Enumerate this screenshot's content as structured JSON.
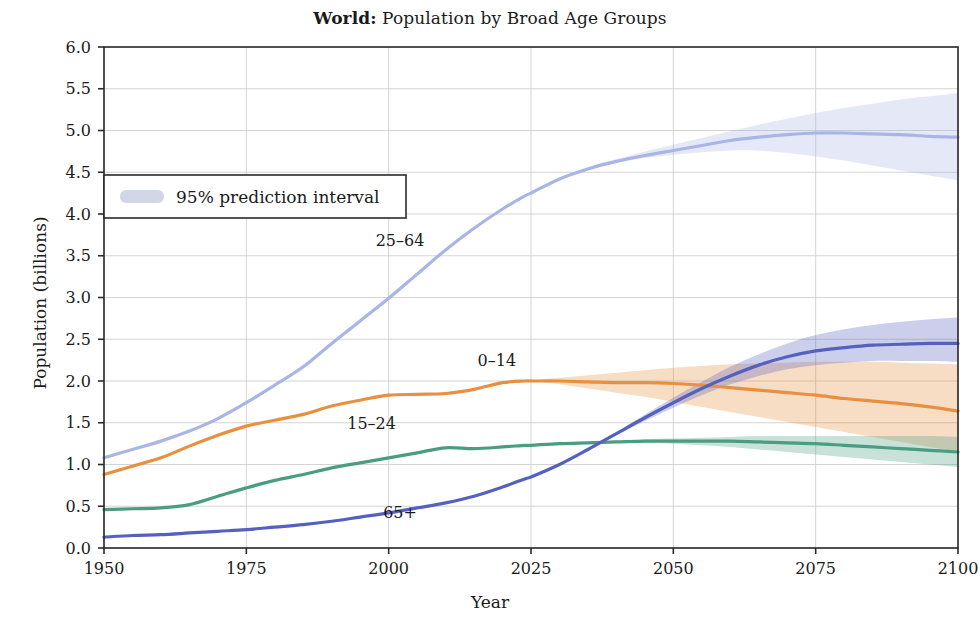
{
  "chart_data": {
    "type": "line",
    "title_prefix": "World:",
    "title": "Population by Broad Age Groups",
    "xlabel": "Year",
    "ylabel": "Population (billions)",
    "xlim": [
      1950,
      2100
    ],
    "ylim": [
      0.0,
      6.0
    ],
    "xticks": [
      1950,
      1975,
      2000,
      2025,
      2050,
      2075,
      2100
    ],
    "xtick_labels": [
      "1950",
      "1975",
      "2000",
      "2025",
      "2050",
      "2075",
      "2100"
    ],
    "yticks": [
      0.0,
      0.5,
      1.0,
      1.5,
      2.0,
      2.5,
      3.0,
      3.5,
      4.0,
      4.5,
      5.0,
      5.5,
      6.0
    ],
    "ytick_labels": [
      "0.0",
      "0.5",
      "1.0",
      "1.5",
      "2.0",
      "2.5",
      "3.0",
      "3.5",
      "4.0",
      "4.5",
      "5.0",
      "5.5",
      "6.0"
    ],
    "grid": true,
    "legend_position": "upper-left",
    "legend_entries": [
      {
        "label": "95% prediction interval",
        "swatch_color": "#c3c9de"
      }
    ],
    "projection_start_year": 2024,
    "x": [
      1950,
      1955,
      1960,
      1965,
      1970,
      1975,
      1980,
      1985,
      1990,
      1995,
      2000,
      2005,
      2010,
      2015,
      2020,
      2024,
      2025,
      2030,
      2035,
      2040,
      2045,
      2050,
      2055,
      2060,
      2065,
      2070,
      2075,
      2080,
      2085,
      2090,
      2095,
      2100
    ],
    "series": [
      {
        "name": "25-64",
        "color": "#a9b5e6",
        "annotation": "25–64",
        "annotation_x": 2002,
        "annotation_y": 3.62,
        "values": [
          1.08,
          1.18,
          1.28,
          1.4,
          1.55,
          1.74,
          1.95,
          2.17,
          2.45,
          2.72,
          2.99,
          3.28,
          3.57,
          3.83,
          4.06,
          4.22,
          4.25,
          4.42,
          4.54,
          4.63,
          4.7,
          4.76,
          4.82,
          4.88,
          4.92,
          4.95,
          4.97,
          4.97,
          4.96,
          4.95,
          4.93,
          4.92
        ],
        "band_low": [
          null,
          null,
          null,
          null,
          null,
          null,
          null,
          null,
          null,
          null,
          null,
          null,
          null,
          null,
          null,
          4.22,
          4.25,
          4.41,
          4.53,
          4.61,
          4.67,
          4.71,
          4.74,
          4.76,
          4.76,
          4.73,
          4.69,
          4.64,
          4.58,
          4.52,
          4.46,
          4.4
        ],
        "band_high": [
          null,
          null,
          null,
          null,
          null,
          null,
          null,
          null,
          null,
          null,
          null,
          null,
          null,
          null,
          null,
          4.22,
          4.25,
          4.43,
          4.56,
          4.66,
          4.75,
          4.83,
          4.91,
          4.99,
          5.07,
          5.14,
          5.21,
          5.27,
          5.32,
          5.37,
          5.41,
          5.45
        ]
      },
      {
        "name": "0-14",
        "color": "#e89040",
        "annotation": "0–14",
        "annotation_x": 2019,
        "annotation_y": 2.18,
        "values": [
          0.88,
          0.98,
          1.08,
          1.22,
          1.35,
          1.46,
          1.53,
          1.6,
          1.7,
          1.77,
          1.83,
          1.84,
          1.85,
          1.9,
          1.98,
          2.0,
          2.0,
          2.0,
          1.99,
          1.98,
          1.98,
          1.97,
          1.95,
          1.92,
          1.89,
          1.86,
          1.83,
          1.79,
          1.76,
          1.73,
          1.69,
          1.64
        ],
        "band_low": [
          null,
          null,
          null,
          null,
          null,
          null,
          null,
          null,
          null,
          null,
          null,
          null,
          null,
          null,
          null,
          2.0,
          2.0,
          1.96,
          1.91,
          1.86,
          1.81,
          1.75,
          1.69,
          1.63,
          1.57,
          1.51,
          1.45,
          1.39,
          1.33,
          1.27,
          1.21,
          1.15
        ],
        "band_high": [
          null,
          null,
          null,
          null,
          null,
          null,
          null,
          null,
          null,
          null,
          null,
          null,
          null,
          null,
          null,
          2.0,
          2.0,
          2.04,
          2.07,
          2.1,
          2.13,
          2.16,
          2.18,
          2.2,
          2.21,
          2.22,
          2.23,
          2.23,
          2.23,
          2.22,
          2.21,
          2.2
        ]
      },
      {
        "name": "15-24",
        "color": "#4a9d80",
        "annotation": "15–24",
        "annotation_x": 1997,
        "annotation_y": 1.43,
        "values": [
          0.46,
          0.47,
          0.48,
          0.52,
          0.62,
          0.72,
          0.81,
          0.88,
          0.96,
          1.02,
          1.08,
          1.14,
          1.2,
          1.19,
          1.21,
          1.23,
          1.23,
          1.25,
          1.26,
          1.27,
          1.28,
          1.28,
          1.28,
          1.28,
          1.27,
          1.26,
          1.25,
          1.23,
          1.21,
          1.19,
          1.17,
          1.15
        ],
        "band_low": [
          null,
          null,
          null,
          null,
          null,
          null,
          null,
          null,
          null,
          null,
          null,
          null,
          null,
          null,
          null,
          1.23,
          1.23,
          1.25,
          1.26,
          1.26,
          1.26,
          1.25,
          1.23,
          1.21,
          1.18,
          1.15,
          1.12,
          1.09,
          1.06,
          1.03,
          1.0,
          0.97
        ],
        "band_high": [
          null,
          null,
          null,
          null,
          null,
          null,
          null,
          null,
          null,
          null,
          null,
          null,
          null,
          null,
          null,
          1.23,
          1.23,
          1.25,
          1.27,
          1.28,
          1.3,
          1.31,
          1.32,
          1.33,
          1.34,
          1.34,
          1.34,
          1.34,
          1.34,
          1.34,
          1.34,
          1.33
        ]
      },
      {
        "name": "65+",
        "color": "#5561bf",
        "annotation": "65+",
        "annotation_x": 2002,
        "annotation_y": 0.36,
        "values": [
          0.13,
          0.15,
          0.16,
          0.18,
          0.2,
          0.22,
          0.25,
          0.28,
          0.32,
          0.37,
          0.42,
          0.48,
          0.54,
          0.62,
          0.73,
          0.83,
          0.85,
          1.0,
          1.18,
          1.37,
          1.56,
          1.74,
          1.91,
          2.06,
          2.19,
          2.29,
          2.36,
          2.4,
          2.43,
          2.44,
          2.45,
          2.45
        ],
        "band_low": [
          null,
          null,
          null,
          null,
          null,
          null,
          null,
          null,
          null,
          null,
          null,
          null,
          null,
          null,
          null,
          0.83,
          0.85,
          1.0,
          1.17,
          1.35,
          1.52,
          1.68,
          1.83,
          1.96,
          2.06,
          2.14,
          2.19,
          2.22,
          2.24,
          2.24,
          2.24,
          2.23
        ],
        "band_high": [
          null,
          null,
          null,
          null,
          null,
          null,
          null,
          null,
          null,
          null,
          null,
          null,
          null,
          null,
          null,
          0.83,
          0.85,
          1.01,
          1.19,
          1.39,
          1.6,
          1.8,
          1.99,
          2.17,
          2.32,
          2.45,
          2.55,
          2.62,
          2.67,
          2.71,
          2.74,
          2.76
        ]
      }
    ]
  }
}
